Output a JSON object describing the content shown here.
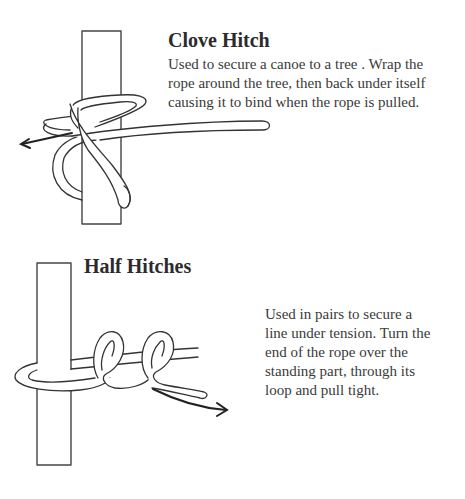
{
  "sections": [
    {
      "title": "Clove Hitch",
      "description_lines": [
        "Used to secure a canoe to a tree . Wrap the",
        "rope around the tree, then back under itself",
        "causing it to bind when the rope is pulled."
      ],
      "illustration": {
        "subject": "rope tied around vertical pole with clove hitch",
        "arrow_direction": "left",
        "icon": "pull-arrow-icon"
      }
    },
    {
      "title": "Half Hitches",
      "description_lines": [
        "Used in pairs to secure a",
        "line under tension. Turn the",
        "end of the rope over the",
        "standing part, through its",
        "loop and pull tight."
      ],
      "illustration": {
        "subject": "rope tied around vertical pole with two half hitches",
        "arrow_direction": "right",
        "icon": "pull-arrow-icon"
      }
    }
  ],
  "colors": {
    "background": "#ffffff",
    "line": "#333333",
    "text": "#2b2b2b"
  }
}
